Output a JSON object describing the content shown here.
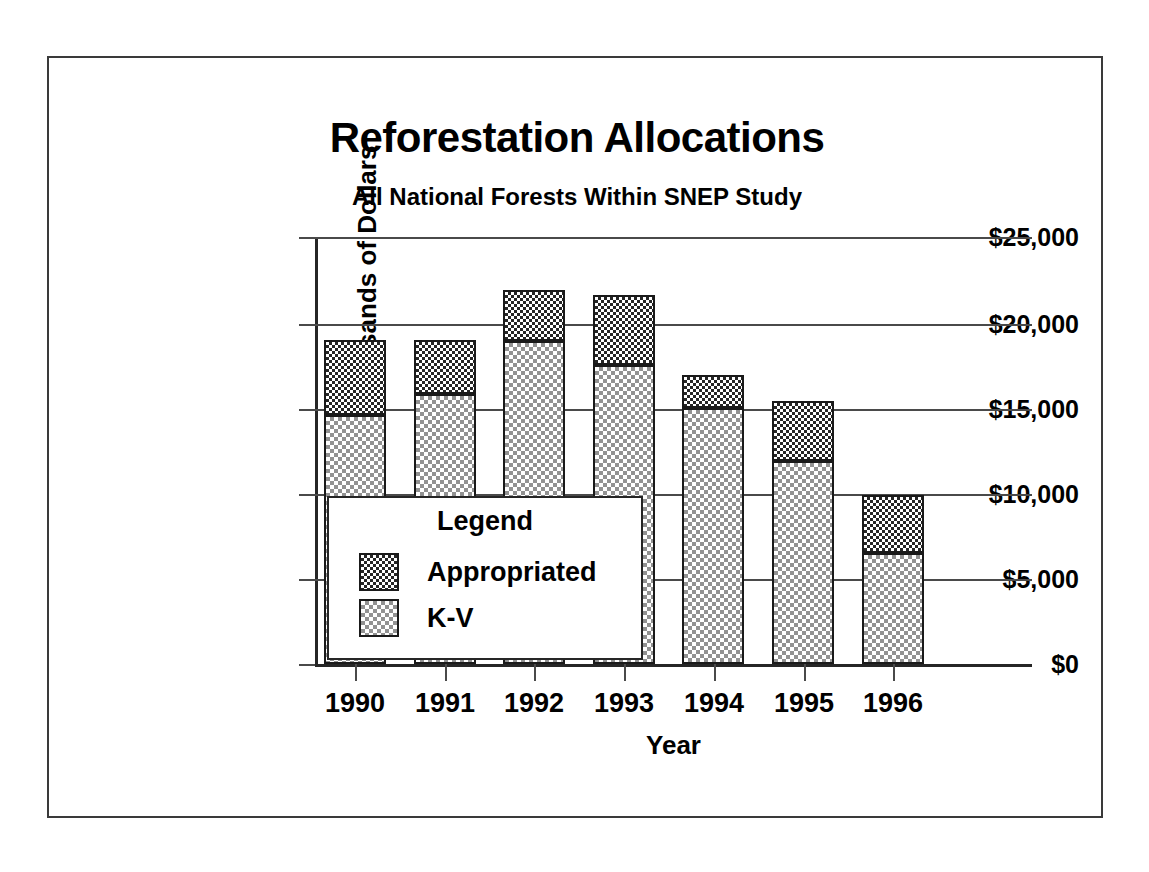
{
  "chart_data": {
    "type": "bar",
    "title": "Reforestation Allocations",
    "subtitle": "All National Forests Within SNEP Study",
    "xlabel": "Year",
    "ylabel": "Thousands of Dollars",
    "stacked": true,
    "grid": true,
    "legend_position": "inside-lower-left",
    "legend_title": "Legend",
    "categories": [
      "1990",
      "1991",
      "1992",
      "1993",
      "1994",
      "1995",
      "1996"
    ],
    "ylim": [
      0,
      25000
    ],
    "ytick_values": [
      0,
      5000,
      10000,
      15000,
      20000,
      25000
    ],
    "ytick_labels": [
      "$0",
      "$5,000",
      "$10,000",
      "$15,000",
      "$20,000",
      "$25,000"
    ],
    "series": [
      {
        "name": "K-V",
        "fill": "light-checkerboard",
        "color": "#c9c9c9",
        "values": [
          14600,
          15800,
          18900,
          17500,
          15000,
          11900,
          6500
        ]
      },
      {
        "name": "Appropriated",
        "fill": "dark-checkerboard",
        "color": "#4a4a4a",
        "values": [
          4400,
          3200,
          3000,
          4100,
          1900,
          3500,
          3400
        ]
      }
    ],
    "totals": [
      19000,
      19000,
      21900,
      21600,
      16900,
      15400,
      9900
    ]
  },
  "legend": {
    "title": "Legend",
    "entries": [
      {
        "label": "Appropriated",
        "fill": "dark-checkerboard"
      },
      {
        "label": "K-V",
        "fill": "light-checkerboard"
      }
    ]
  }
}
